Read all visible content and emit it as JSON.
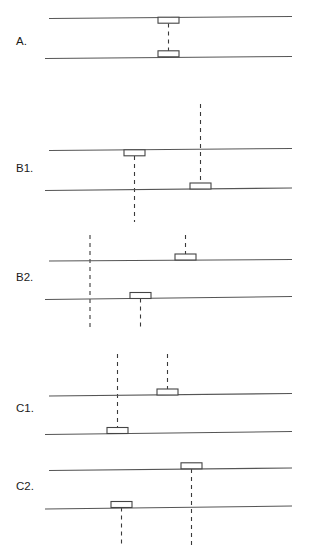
{
  "figure": {
    "width": 314,
    "height": 558,
    "background": "#ffffff",
    "line_color": "#555555",
    "box_stroke": "#444444",
    "box_fill": "#ffffff",
    "dash_color": "#3a3a3a",
    "label_color": "#1a1a1a",
    "line_width": 1.1,
    "dash_pattern": "4,4"
  },
  "panels": [
    {
      "id": "A",
      "label": "A.",
      "label_x": 16,
      "label_y": 45,
      "lines": [
        {
          "name": "upper-line",
          "x1": 49,
          "y1": 18.5,
          "x2": 292,
          "y2": 16.5
        },
        {
          "name": "lower-line",
          "x1": 45,
          "y1": 58.5,
          "x2": 292,
          "y2": 56.5
        }
      ],
      "boxes": [
        {
          "name": "box-upper",
          "x": 158,
          "y": 17.2,
          "width": 21,
          "height": 6,
          "side": "below"
        },
        {
          "name": "box-lower",
          "x": 158,
          "y": 50.8,
          "width": 21,
          "height": 6,
          "side": "above"
        }
      ],
      "dashes": [
        {
          "name": "connector-dash",
          "x": 168.5,
          "y1": 23.5,
          "y2": 51.0
        }
      ]
    },
    {
      "id": "B1",
      "label": "B1.",
      "label_x": 16,
      "label_y": 172,
      "lines": [
        {
          "name": "upper-line",
          "x1": 49,
          "y1": 150.5,
          "x2": 292,
          "y2": 148.5
        },
        {
          "name": "lower-line",
          "x1": 45,
          "y1": 190.5,
          "x2": 292,
          "y2": 188.0
        }
      ],
      "boxes": [
        {
          "name": "box-upper",
          "x": 124,
          "y": 149.8,
          "width": 21,
          "height": 6,
          "side": "below"
        },
        {
          "name": "box-lower",
          "x": 190,
          "y": 183.0,
          "width": 21,
          "height": 6,
          "side": "above"
        }
      ],
      "dashes": [
        {
          "name": "dash-from-upper-box",
          "x": 134.5,
          "y1": 156.0,
          "y2": 222.0
        },
        {
          "name": "dash-from-lower-box",
          "x": 200.5,
          "y1": 104.0,
          "y2": 183.5
        }
      ]
    },
    {
      "id": "B2",
      "label": "B2.",
      "label_x": 16,
      "label_y": 281,
      "lines": [
        {
          "name": "upper-line",
          "x1": 49,
          "y1": 261.0,
          "x2": 292,
          "y2": 259.5
        },
        {
          "name": "lower-line",
          "x1": 45,
          "y1": 299.5,
          "x2": 292,
          "y2": 296.5
        }
      ],
      "boxes": [
        {
          "name": "box-upper",
          "x": 175,
          "y": 254.0,
          "width": 21,
          "height": 6,
          "side": "above"
        },
        {
          "name": "box-lower",
          "x": 130,
          "y": 292.5,
          "width": 21,
          "height": 6,
          "side": "below"
        }
      ],
      "dashes": [
        {
          "name": "dash-crossing-left",
          "x": 90.0,
          "y1": 235.0,
          "y2": 327.0
        },
        {
          "name": "dash-from-upper-box",
          "x": 185.5,
          "y1": 235.0,
          "y2": 254.5
        },
        {
          "name": "dash-from-lower-box",
          "x": 140.5,
          "y1": 298.5,
          "y2": 327.0
        }
      ]
    },
    {
      "id": "C1",
      "label": "C1.",
      "label_x": 16,
      "label_y": 412,
      "lines": [
        {
          "name": "upper-line",
          "x1": 49,
          "y1": 396.0,
          "x2": 292,
          "y2": 393.5
        },
        {
          "name": "lower-line",
          "x1": 45,
          "y1": 434.5,
          "x2": 292,
          "y2": 431.5
        }
      ],
      "boxes": [
        {
          "name": "box-upper",
          "x": 157,
          "y": 389.0,
          "width": 21,
          "height": 6,
          "side": "above"
        },
        {
          "name": "box-lower",
          "x": 107,
          "y": 427.5,
          "width": 21,
          "height": 6,
          "side": "above"
        }
      ],
      "dashes": [
        {
          "name": "dash-from-lower-box",
          "x": 117.5,
          "y1": 354.0,
          "y2": 428.0
        },
        {
          "name": "dash-from-upper-box",
          "x": 167.5,
          "y1": 354.0,
          "y2": 389.5
        }
      ]
    },
    {
      "id": "C2",
      "label": "C2.",
      "label_x": 16,
      "label_y": 490,
      "lines": [
        {
          "name": "upper-line",
          "x1": 49,
          "y1": 470.5,
          "x2": 292,
          "y2": 468.0
        },
        {
          "name": "lower-line",
          "x1": 45,
          "y1": 509.0,
          "x2": 292,
          "y2": 506.0
        }
      ],
      "boxes": [
        {
          "name": "box-upper",
          "x": 181,
          "y": 462.8,
          "width": 21,
          "height": 6,
          "side": "above"
        },
        {
          "name": "box-lower",
          "x": 111,
          "y": 501.5,
          "width": 21,
          "height": 6,
          "side": "above"
        }
      ],
      "dashes": [
        {
          "name": "dash-from-upper-box",
          "x": 191.5,
          "y1": 469.0,
          "y2": 545.0
        },
        {
          "name": "dash-from-lower-box",
          "x": 121.5,
          "y1": 507.5,
          "y2": 545.0
        }
      ]
    }
  ]
}
